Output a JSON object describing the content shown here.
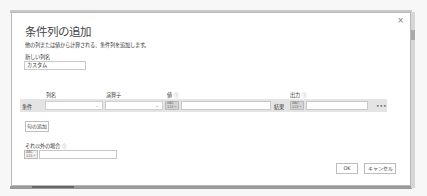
{
  "dialog": {
    "title": "条件列の追加",
    "subtitle": "他の列または値から計算される、条件列を追加します。",
    "close_icon": "×",
    "new_column_label": "新しい列名",
    "new_column_value": "カスタム",
    "headers": {
      "column_name": "列名",
      "operator": "演算子",
      "value": "値",
      "output": "出力",
      "info_icon": "ⓘ"
    },
    "condition_row": {
      "label": "条件",
      "column_name_value": "",
      "operator_value": "",
      "value_type": "ABC 123",
      "value_value": "",
      "result_label": "結果",
      "output_type": "ABC 123",
      "output_value": "",
      "more_icon": "•••"
    },
    "add_clause_button": "句の追加",
    "else_label": "それ以外の場合",
    "else_type": "ABC 123",
    "else_value": "",
    "ok_button": "OK",
    "cancel_button": "キャンセル"
  }
}
